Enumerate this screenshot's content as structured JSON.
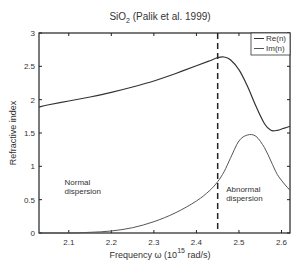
{
  "chart_data": {
    "type": "line",
    "title": "SiO",
    "title_subscript": "2",
    "title_suffix": " (Palik et al. 1999)",
    "xlabel": "Frequency  ω (10",
    "xlabel_superscript": "15",
    "xlabel_suffix": " rad/s)",
    "ylabel": "Refractive index",
    "xlim": [
      2.03,
      2.62
    ],
    "ylim": [
      0,
      3
    ],
    "xticks": [
      2.1,
      2.2,
      2.3,
      2.4,
      2.5,
      2.6
    ],
    "xtick_labels": [
      "2.1",
      "2.2",
      "2.3",
      "2.4",
      "2.5",
      "2.6"
    ],
    "yticks": [
      0,
      0.5,
      1,
      1.5,
      2,
      2.5,
      3
    ],
    "ytick_labels": [
      "0",
      "0.5",
      "1",
      "1.5",
      "2",
      "2.5",
      "3"
    ],
    "grid": false,
    "legend_position": "upper right",
    "vline": {
      "x": 2.45,
      "style": "dashed"
    },
    "annotations": [
      {
        "text": [
          "Normal",
          "dispersion"
        ],
        "x": 2.09,
        "y": 0.72
      },
      {
        "text": [
          "Abnormal",
          "dispersion"
        ],
        "x": 2.47,
        "y": 0.62
      }
    ],
    "x": [
      2.03,
      2.05,
      2.1,
      2.15,
      2.2,
      2.25,
      2.3,
      2.35,
      2.4,
      2.43,
      2.45,
      2.465,
      2.48,
      2.5,
      2.52,
      2.54,
      2.56,
      2.575,
      2.59,
      2.605,
      2.62
    ],
    "series": [
      {
        "name": "Re(n)",
        "color": "#333333",
        "values": [
          1.89,
          1.92,
          1.98,
          2.04,
          2.11,
          2.19,
          2.28,
          2.39,
          2.51,
          2.58,
          2.63,
          2.64,
          2.6,
          2.45,
          2.2,
          1.9,
          1.64,
          1.54,
          1.54,
          1.57,
          1.6
        ]
      },
      {
        "name": "Im(n)",
        "color": "#555555",
        "values": [
          0.0,
          0.0,
          0.0,
          0.01,
          0.03,
          0.08,
          0.17,
          0.3,
          0.48,
          0.63,
          0.77,
          0.92,
          1.12,
          1.38,
          1.47,
          1.45,
          1.28,
          1.08,
          0.88,
          0.75,
          0.64
        ]
      }
    ]
  }
}
